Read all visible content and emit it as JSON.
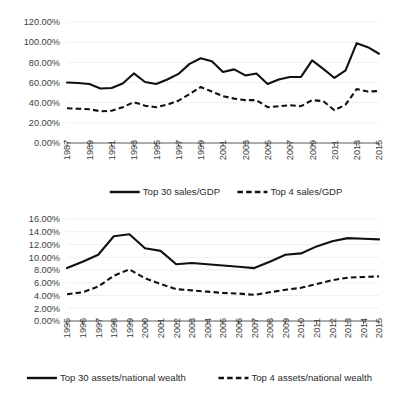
{
  "page": {
    "background": "#ffffff",
    "line_color": "#111111",
    "text_color": "#262626",
    "grid_color": "#f0f0f0"
  },
  "chart_data": [
    {
      "id": "sales-gdp",
      "type": "line",
      "title": "",
      "xlabel": "",
      "ylabel": "",
      "grid": true,
      "legend_position": "bottom",
      "ylim": [
        0,
        120
      ],
      "ytick_labels": [
        "0.00%",
        "20.00%",
        "40.00%",
        "60.00%",
        "80.00%",
        "100.00%",
        "120.00%"
      ],
      "ytick_values": [
        0,
        20,
        40,
        60,
        80,
        100,
        120
      ],
      "x": [
        1987,
        1988,
        1989,
        1990,
        1991,
        1992,
        1993,
        1994,
        1995,
        1996,
        1997,
        1998,
        1999,
        2000,
        2001,
        2002,
        2003,
        2004,
        2005,
        2006,
        2007,
        2008,
        2009,
        2010,
        2011,
        2012,
        2013,
        2014,
        2015
      ],
      "xtick_labels": [
        "1987",
        "1989",
        "1991",
        "1993",
        "1995",
        "1997",
        "1999",
        "2001",
        "2003",
        "2005",
        "2007",
        "2009",
        "2011",
        "2013",
        "2015"
      ],
      "series": [
        {
          "name": "Top 30 sales/GDP",
          "style": "solid",
          "values": [
            60.0,
            59.5,
            58.5,
            54.0,
            54.5,
            59.0,
            69.0,
            60.5,
            58.5,
            63.0,
            68.5,
            78.5,
            84.0,
            81.0,
            70.5,
            73.0,
            67.0,
            69.0,
            58.5,
            63.0,
            65.5,
            65.5,
            82.0,
            73.5,
            64.5,
            72.0,
            99.0,
            95.0,
            88.5
          ]
        },
        {
          "name": "Top 4 sales/GDP",
          "style": "dashed",
          "values": [
            34.5,
            34.0,
            33.5,
            31.5,
            32.0,
            35.5,
            40.5,
            37.0,
            35.5,
            38.0,
            42.0,
            48.5,
            55.5,
            51.0,
            46.5,
            44.0,
            42.5,
            42.5,
            35.5,
            36.5,
            37.5,
            36.5,
            42.5,
            41.5,
            32.5,
            38.0,
            53.5,
            51.0,
            51.5
          ]
        }
      ]
    },
    {
      "id": "assets-national-wealth",
      "type": "line",
      "title": "",
      "xlabel": "",
      "ylabel": "",
      "grid": true,
      "legend_position": "bottom",
      "ylim": [
        0,
        16
      ],
      "ytick_labels": [
        "0.00%",
        "2.00%",
        "4.00%",
        "6.00%",
        "8.00%",
        "10.00%",
        "12.00%",
        "14.00%",
        "16.00%"
      ],
      "ytick_values": [
        0,
        2,
        4,
        6,
        8,
        10,
        12,
        14,
        16
      ],
      "x": [
        1995,
        1996,
        1997,
        1998,
        1999,
        2000,
        2001,
        2002,
        2003,
        2004,
        2005,
        2006,
        2007,
        2008,
        2009,
        2010,
        2011,
        2012,
        2013,
        2014,
        2015
      ],
      "xtick_labels": [
        "1995",
        "1996",
        "1997",
        "1998",
        "1999",
        "2000",
        "2001",
        "2002",
        "2003",
        "2004",
        "2005",
        "2006",
        "2007",
        "2008",
        "2009",
        "2010",
        "2011",
        "2012",
        "2013",
        "2014",
        "2015"
      ],
      "series": [
        {
          "name": "Top 30 assets/national wealth",
          "style": "solid",
          "values": [
            8.3,
            9.3,
            10.4,
            13.3,
            13.6,
            11.4,
            11.0,
            8.9,
            9.1,
            8.9,
            8.7,
            8.5,
            8.3,
            9.3,
            10.4,
            10.6,
            11.7,
            12.5,
            13.0,
            12.9,
            12.8
          ]
        },
        {
          "name": "Top 4 assets/national wealth",
          "style": "dashed",
          "values": [
            4.2,
            4.5,
            5.4,
            7.1,
            8.1,
            6.7,
            5.8,
            5.0,
            4.8,
            4.6,
            4.4,
            4.3,
            4.1,
            4.5,
            4.9,
            5.2,
            5.8,
            6.4,
            6.8,
            6.9,
            7.0
          ]
        }
      ]
    }
  ]
}
